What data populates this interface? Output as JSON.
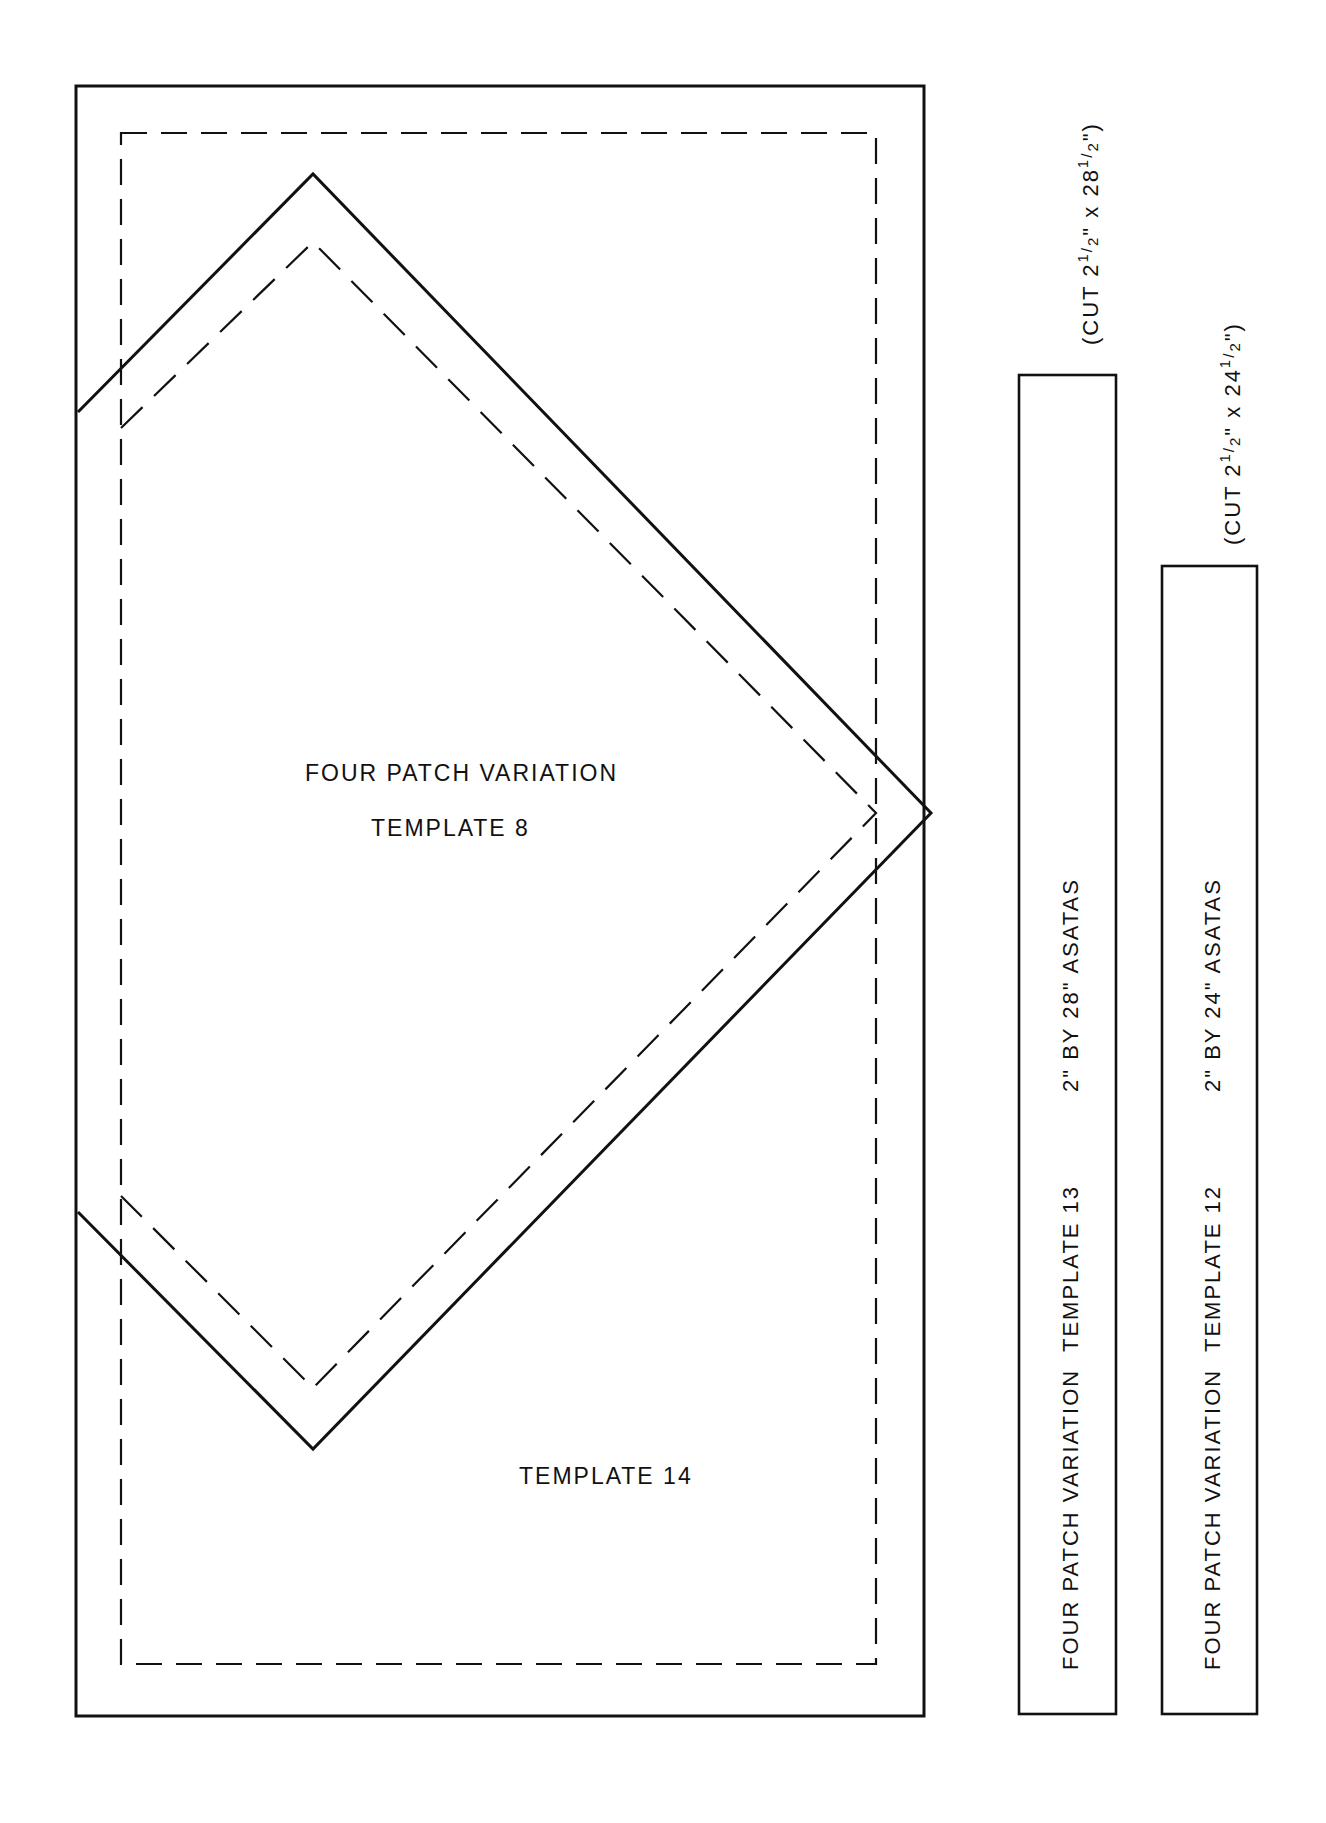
{
  "colors": {
    "ink": "#111111",
    "paper": "#ffffff"
  },
  "main_template": {
    "outer_rect": {
      "x": 76,
      "y": 86,
      "w": 848,
      "h": 1630
    },
    "seam_rect": {
      "x": 121,
      "y": 133,
      "w": 755,
      "h": 1531
    },
    "diamond_label_line1": "FOUR PATCH VARIATION",
    "diamond_label_line2": "TEMPLATE 8",
    "lower_label": "TEMPLATE 14"
  },
  "strips": [
    {
      "id": "template-13",
      "rect": {
        "x": 1019,
        "y": 375,
        "w": 97,
        "h": 1339
      },
      "pattern_label": "FOUR PATCH VARIATION",
      "template_label": "TEMPLATE 13",
      "size_label": "2\" BY 28\"  ASATAS",
      "cut_note": {
        "prefix": "(CUT 2",
        "frac1_num": "1",
        "frac1_den": "2",
        "mid": "\"  x  28",
        "frac2_num": "1",
        "frac2_den": "2",
        "suffix": "\")"
      },
      "cut_note_full": "(CUT 2 1/2\" x 28 1/2\")"
    },
    {
      "id": "template-12",
      "rect": {
        "x": 1162,
        "y": 566,
        "w": 95,
        "h": 1148
      },
      "pattern_label": "FOUR PATCH VARIATION",
      "template_label": "TEMPLATE 12",
      "size_label": "2\" BY 24\"  ASATAS",
      "cut_note": {
        "prefix": "(CUT 2",
        "frac1_num": "1",
        "frac1_den": "2",
        "mid": "\"  x  24",
        "frac2_num": "1",
        "frac2_den": "2",
        "suffix": "\")"
      },
      "cut_note_full": "(CUT 2 1/2\" x 24 1/2\")"
    }
  ]
}
